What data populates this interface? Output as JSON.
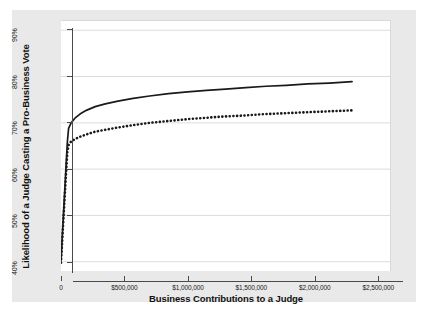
{
  "chart_data": {
    "type": "line",
    "title": "",
    "xlabel": "Business Contributions to a Judge",
    "ylabel": "Likelihood of a Judge Casting a Pro-Business Vote",
    "xlim": [
      0,
      2600000
    ],
    "ylim": [
      0.38,
      0.92
    ],
    "grid": true,
    "grid_axis": "y",
    "legend": "none",
    "xticks": [
      0,
      500000,
      1000000,
      1500000,
      2000000,
      2500000
    ],
    "xtick_labels": [
      "0",
      "$500,000",
      "$1,000,000",
      "$1,500,000",
      "$2,000,000",
      "$2,500,000"
    ],
    "yticks": [
      0.4,
      0.5,
      0.6,
      0.7,
      0.8,
      0.9
    ],
    "ytick_labels": [
      "40%",
      "50%",
      "60%",
      "70%",
      "80%",
      "90%"
    ],
    "series": [
      {
        "name": "upper-curve",
        "style": "solid",
        "color": "#1a1a1a",
        "x": [
          0,
          10000,
          20000,
          30000,
          40000,
          50000,
          60000,
          80000,
          110000,
          150000,
          200000,
          270000,
          350000,
          450000,
          570000,
          700000,
          850000,
          1000000,
          1150000,
          1300000,
          1460000,
          1620000,
          1780000,
          1950000,
          2120000,
          2300000
        ],
        "y": [
          0.402,
          0.455,
          0.506,
          0.556,
          0.608,
          0.658,
          0.688,
          0.7,
          0.71,
          0.719,
          0.727,
          0.735,
          0.741,
          0.747,
          0.753,
          0.758,
          0.763,
          0.767,
          0.77,
          0.773,
          0.776,
          0.779,
          0.781,
          0.784,
          0.786,
          0.789
        ]
      },
      {
        "name": "lower-curve",
        "style": "dotted",
        "color": "#1a1a1a",
        "x": [
          0,
          10000,
          20000,
          30000,
          40000,
          50000,
          60000,
          80000,
          110000,
          150000,
          200000,
          270000,
          350000,
          450000,
          570000,
          700000,
          850000,
          1000000,
          1150000,
          1300000,
          1460000,
          1620000,
          1780000,
          1950000,
          2120000,
          2300000
        ],
        "y": [
          0.398,
          0.448,
          0.496,
          0.544,
          0.592,
          0.636,
          0.652,
          0.66,
          0.665,
          0.67,
          0.675,
          0.681,
          0.685,
          0.69,
          0.695,
          0.7,
          0.704,
          0.708,
          0.711,
          0.714,
          0.716,
          0.719,
          0.721,
          0.723,
          0.725,
          0.727
        ]
      }
    ]
  },
  "axes": {
    "x_title": "Business Contributions to a Judge",
    "y_title": "Likelihood of a Judge Casting a Pro-Business Vote"
  }
}
